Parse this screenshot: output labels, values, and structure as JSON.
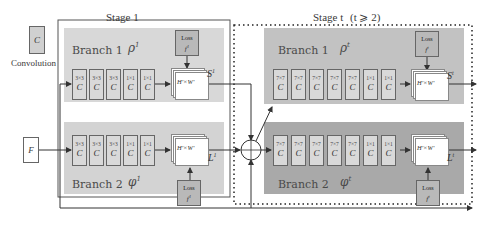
{
  "legend": {
    "conv_symbol": "C",
    "conv_label": "Convolution"
  },
  "input": {
    "label": "F"
  },
  "stage1": {
    "title": "Stage 1",
    "branch1": {
      "label": "Branch 1",
      "greek": "ρ",
      "sup": "1",
      "convs": [
        "3×3",
        "3×3",
        "3×3",
        "1×1",
        "1×1"
      ],
      "conv_symbol": "C",
      "fmap_label": "H'×W'",
      "output": "S",
      "output_sup": "1",
      "loss": {
        "title": "Loss",
        "fn": "f",
        "fn_sub": "1",
        "fn_sup": "1"
      }
    },
    "branch2": {
      "label": "Branch 2",
      "greek": "φ",
      "sup": "1",
      "convs": [
        "3×3",
        "3×3",
        "3×3",
        "1×1",
        "1×1"
      ],
      "conv_symbol": "C",
      "fmap_label": "H'×W'",
      "output": "L",
      "output_sup": "1",
      "loss": {
        "title": "Loss",
        "fn": "f",
        "fn_sub": "2",
        "fn_sup": "1"
      }
    }
  },
  "stageT": {
    "title": "Stage t",
    "condition": "(t ⩾ 2)",
    "branch1": {
      "label": "Branch 1",
      "greek": "ρ",
      "sup": "t",
      "convs": [
        "7×7",
        "7×7",
        "7×7",
        "7×7",
        "7×7",
        "1×1",
        "1×1"
      ],
      "conv_symbol": "C",
      "fmap_label": "H'×W'",
      "output": "S",
      "output_sup": "t",
      "loss": {
        "title": "Loss",
        "fn": "f",
        "fn_sub": "1",
        "fn_sup": "t"
      }
    },
    "branch2": {
      "label": "Branch 2",
      "greek": "φ",
      "sup": "t",
      "convs": [
        "7×7",
        "7×7",
        "7×7",
        "7×7",
        "7×7",
        "1×1",
        "1×1"
      ],
      "conv_symbol": "C",
      "fmap_label": "H'×W'",
      "output": "L",
      "output_sup": "t",
      "loss": {
        "title": "Loss",
        "fn": "f",
        "fn_sub": "2",
        "fn_sup": "t"
      }
    }
  },
  "colors": {
    "stage1_branch_bg": "#d8d8d8",
    "stageT_branch1_bg": "#c2c2c2",
    "stageT_branch2_bg": "#a9a9a9",
    "loss_bg": "#b9b9b9",
    "line": "#333333"
  }
}
